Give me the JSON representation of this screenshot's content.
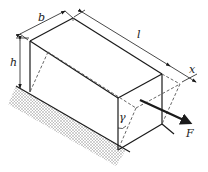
{
  "figure": {
    "labels": {
      "width": "b",
      "length": "l",
      "height": "h",
      "displacement": "x",
      "shear_angle": "γ",
      "force": "F"
    },
    "colors": {
      "line": "#1a1a1a",
      "dashed": "#555555",
      "hatch": "#b8b8b8",
      "background": "#ffffff"
    }
  }
}
